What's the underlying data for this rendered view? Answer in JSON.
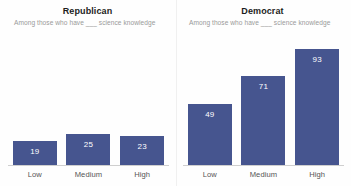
{
  "chart_data": {
    "type": "bar",
    "title": "",
    "categories": [
      "Low",
      "Medium",
      "High"
    ],
    "xlabel": "",
    "ylabel": "",
    "ylim": [
      0,
      100
    ],
    "grid": false,
    "legend": "none",
    "bar_color": "#46558f",
    "panels": [
      {
        "title": "Republican",
        "subtitle": "Among those who have ___ science knowledge",
        "categories": [
          "Low",
          "Medium",
          "High"
        ],
        "values": [
          19,
          25,
          23
        ]
      },
      {
        "title": "Democrat",
        "subtitle": "Among those who have ___ science knowledge",
        "categories": [
          "Low",
          "Medium",
          "High"
        ],
        "values": [
          49,
          71,
          93
        ]
      }
    ],
    "series": [
      {
        "name": "Republican",
        "values": [
          19,
          25,
          23
        ]
      },
      {
        "name": "Democrat",
        "values": [
          49,
          71,
          93
        ]
      }
    ]
  }
}
